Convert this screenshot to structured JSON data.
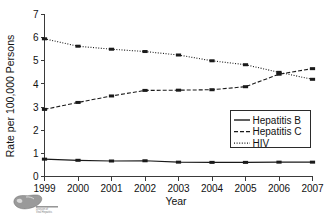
{
  "figure": {
    "background_color": "#ffffff",
    "line_color": "#1a1a1a",
    "axis_color": "#3a3a3a"
  },
  "logo": {
    "name": "liver-logo",
    "caption_line1": "Division of",
    "caption_line2": "Viral Hepatitis"
  },
  "chart_data": {
    "type": "line",
    "title": "",
    "xlabel": "Year",
    "ylabel": "Rate per 100,000 Persons",
    "x": [
      1999,
      2000,
      2001,
      2002,
      2003,
      2004,
      2005,
      2006,
      2007
    ],
    "categories": [
      "1999",
      "2000",
      "2001",
      "2002",
      "2003",
      "2004",
      "2005",
      "2006",
      "2007"
    ],
    "xlim": [
      1999,
      2007
    ],
    "ylim": [
      0,
      7
    ],
    "yticks": [
      0,
      1,
      2,
      3,
      4,
      5,
      6,
      7
    ],
    "ytick_labels": [
      "0",
      "1",
      "2",
      "3",
      "4",
      "5",
      "6",
      "7"
    ],
    "grid": false,
    "legend_position": "center-right",
    "markers": "square",
    "series": [
      {
        "name": "Hepatitis B",
        "style": "solid",
        "values": [
          0.75,
          0.7,
          0.67,
          0.68,
          0.62,
          0.61,
          0.61,
          0.62,
          0.62
        ]
      },
      {
        "name": "Hepatitis C",
        "style": "dashed",
        "values": [
          2.9,
          3.2,
          3.48,
          3.72,
          3.73,
          3.75,
          3.88,
          4.42,
          4.66
        ]
      },
      {
        "name": "HIV",
        "style": "dotted",
        "values": [
          5.95,
          5.63,
          5.5,
          5.4,
          5.25,
          5.0,
          4.83,
          4.5,
          4.2
        ]
      }
    ]
  }
}
